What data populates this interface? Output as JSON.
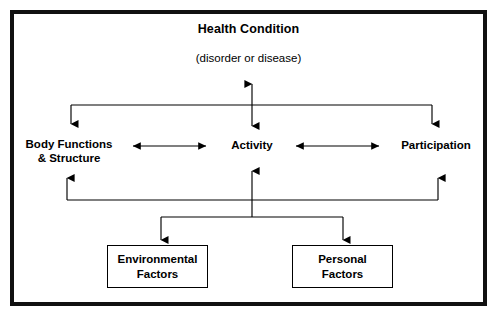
{
  "diagram": {
    "title": "Health Condition",
    "subtitle": "(disorder or disease)",
    "frame_color": "#111111",
    "line_color": "#000000",
    "background": "#ffffff",
    "nodes": {
      "health_condition": "Health Condition",
      "health_condition_detail": "(disorder or disease)",
      "body_functions": "Body Functions\n& Structure",
      "activity": "Activity",
      "participation": "Participation",
      "environmental_factors": "Environmental\nFactors",
      "personal_factors": "Personal\nFactors"
    }
  }
}
